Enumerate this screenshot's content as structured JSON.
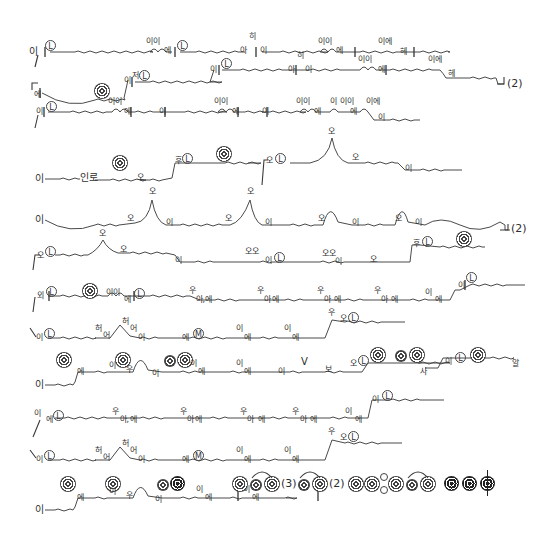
{
  "document": {
    "type": "chant notation score",
    "lines": [
      {
        "id": 1,
        "syllables": [
          "이",
          "ⓛ",
          "이이",
          "에",
          "ⓛ",
          "아",
          "히",
          "이",
          "이이",
          "에",
          "이에",
          "헤"
        ]
      },
      {
        "id": 2,
        "syllables": [
          "에",
          "이",
          "저",
          "ⓛ",
          "이",
          "ⓛ",
          "아",
          "히",
          "이",
          "이이",
          "에",
          "이에",
          "헤"
        ],
        "repeat": "(2)"
      },
      {
        "id": 3,
        "syllables": [
          "이",
          "ⓛ",
          "이이",
          "에",
          "이",
          "이이",
          "에",
          "이",
          "이이",
          "에",
          "이",
          "이이",
          "에",
          "이",
          "이에",
          "이"
        ]
      },
      {
        "id": 4,
        "syllables": [
          "이",
          "인",
          "로",
          "오",
          "후",
          "ⓛ",
          "오",
          "ⓛ",
          "오",
          "이"
        ]
      },
      {
        "id": 5,
        "syllables": [
          "이",
          "오",
          "오",
          "이",
          "오",
          "오",
          "이",
          "오",
          "이",
          "오",
          "이"
        ],
        "repeat": "(2)"
      },
      {
        "id": 6,
        "syllables": [
          "오",
          "ⓛ",
          "오",
          "오",
          "이",
          "오오",
          "이",
          "ⓛ",
          "오오",
          "이",
          "오",
          "후",
          "ⓛ"
        ]
      },
      {
        "id": 7,
        "syllables": [
          "외",
          "ⓛ",
          "이이",
          "에",
          "ⓛ",
          "우",
          "아,",
          "에",
          "우",
          "아",
          "에",
          "우",
          "아",
          "에",
          "우",
          "아",
          "에",
          "이",
          "에",
          "이",
          "ⓛ"
        ]
      },
      {
        "id": 8,
        "syllables": [
          "이",
          "ⓛ",
          "허",
          "어",
          "허",
          "어",
          "이",
          "에",
          "Ⓜ",
          "이",
          "에",
          "이",
          "에",
          "우",
          "오",
          "ⓛ"
        ]
      },
      {
        "id": 9,
        "syllables": [
          "이",
          "에",
          "이",
          "우",
          "이",
          "이",
          "에",
          "이",
          "에",
          "이",
          "V",
          "보",
          "오",
          "ⓛ",
          "사",
          "이",
          "ⓛ",
          "알"
        ]
      },
      {
        "id": 10,
        "syllables": [
          "이",
          "에",
          "ⓛ",
          "우",
          "아,",
          "에",
          "우",
          "아",
          "에",
          "우",
          "아",
          "에",
          "우",
          "아",
          "에",
          "이",
          "에",
          "이",
          "ⓛ"
        ]
      },
      {
        "id": 11,
        "syllables": [
          "이",
          "ⓛ",
          "허",
          "어",
          "허",
          "어",
          "이",
          "에",
          "Ⓜ",
          "이",
          "에",
          "이",
          "에",
          "우",
          "오",
          "ⓛ"
        ]
      },
      {
        "id": 12,
        "syllables": [
          "이",
          "에",
          "이",
          "우",
          "이",
          "이",
          "에",
          "이",
          "에"
        ]
      }
    ],
    "repeat_marks": [
      "(2)",
      "(2)",
      "(3)",
      "(2)"
    ],
    "legend_row": {
      "labels": [
        "(3)",
        "(2)"
      ]
    }
  },
  "text": {
    "l1": {
      "a": "이",
      "b": "이이",
      "c": "에",
      "d": "아",
      "e": "히",
      "f": "이",
      "g": "이이",
      "h": "에",
      "i": "이에",
      "j": "헤"
    },
    "l2": {
      "a": "에",
      "b": "이",
      "c": "저",
      "d": "이",
      "e": "아",
      "f": "히",
      "g": "이",
      "h": "이이",
      "i": "에",
      "j": "이에",
      "k": "헤",
      "rep": "(2)"
    },
    "l3": {
      "a": "이",
      "b": "이이",
      "c": "에",
      "d": "이",
      "e": "이이",
      "f": "에",
      "g": "이",
      "h": "이이",
      "i": "에",
      "j": "이",
      "k": "이이",
      "l": "에",
      "m": "이에",
      "n": "이"
    },
    "l4": {
      "a": "이",
      "b": "인",
      "c": "로",
      "d": "오",
      "e": "후",
      "f": "오",
      "g": "이"
    },
    "l5": {
      "a": "이",
      "b": "오",
      "c": "오",
      "d": "이",
      "e": "오",
      "f": "오",
      "g": "이",
      "h": "오",
      "i": "이",
      "j": "오",
      "k": "이",
      "rep": "(2)"
    },
    "l6": {
      "a": "오",
      "b": "오",
      "c": "오",
      "d": "이",
      "e": "오오",
      "f": "이",
      "g": "오오",
      "h": "이",
      "i": "오",
      "j": "후"
    },
    "l7": {
      "a": "외",
      "b": "이이",
      "c": "에",
      "d": "우",
      "e": "아,",
      "f": "에",
      "g": "우",
      "h": "아",
      "i": "에",
      "j": "우",
      "k": "아",
      "l": "에",
      "m": "우",
      "n": "아",
      "o": "에",
      "p": "이",
      "q": "에",
      "r": "이"
    },
    "l8": {
      "a": "이",
      "b": "허",
      "c": "어",
      "d": "허",
      "e": "어",
      "f": "이",
      "g": "에",
      "h": "이",
      "i": "에",
      "j": "이",
      "k": "에",
      "l": "우",
      "m": "오"
    },
    "l9": {
      "a": "이",
      "b": "에",
      "c": "이",
      "d": "우",
      "e": "이",
      "f": "이",
      "g": "에",
      "h": "이",
      "i": "에",
      "j": "이",
      "k": "V",
      "l": "보",
      "m": "오",
      "n": "사",
      "o": "이",
      "p": "알"
    },
    "l10": {
      "a": "이",
      "b": "에",
      "c": "우",
      "d": "아,",
      "e": "에",
      "f": "우",
      "g": "아",
      "h": "에",
      "i": "우",
      "j": "아",
      "k": "에",
      "l": "우",
      "m": "아",
      "n": "에",
      "o": "이",
      "p": "에",
      "q": "이"
    },
    "l11": {
      "a": "이",
      "b": "허",
      "c": "어",
      "d": "허",
      "e": "어",
      "f": "이",
      "g": "에",
      "h": "이",
      "i": "에",
      "j": "이",
      "k": "에",
      "l": "우",
      "m": "오"
    },
    "l12": {
      "a": "이",
      "b": "에",
      "c": "이",
      "d": "우",
      "e": "이",
      "f": "이",
      "g": "에",
      "h": "이",
      "i": "에"
    },
    "legend": {
      "three": "(3)",
      "two": "(2)"
    },
    "symbols": {
      "L": "L",
      "M": "M"
    }
  }
}
